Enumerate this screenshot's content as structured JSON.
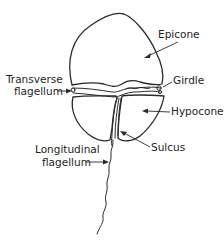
{
  "diagram": {
    "labels": {
      "epicone": "Epicone",
      "transverse_line1": "Transverse",
      "transverse_line2": "flagellum",
      "girdle": "Girdle",
      "hypocone": "Hypocone",
      "sulcus": "Sulcus",
      "longitudinal_line1": "Longitudinal",
      "longitudinal_line2": "flagellum"
    },
    "colors": {
      "line": "#2a2a2a",
      "background": "#ffffff"
    }
  }
}
